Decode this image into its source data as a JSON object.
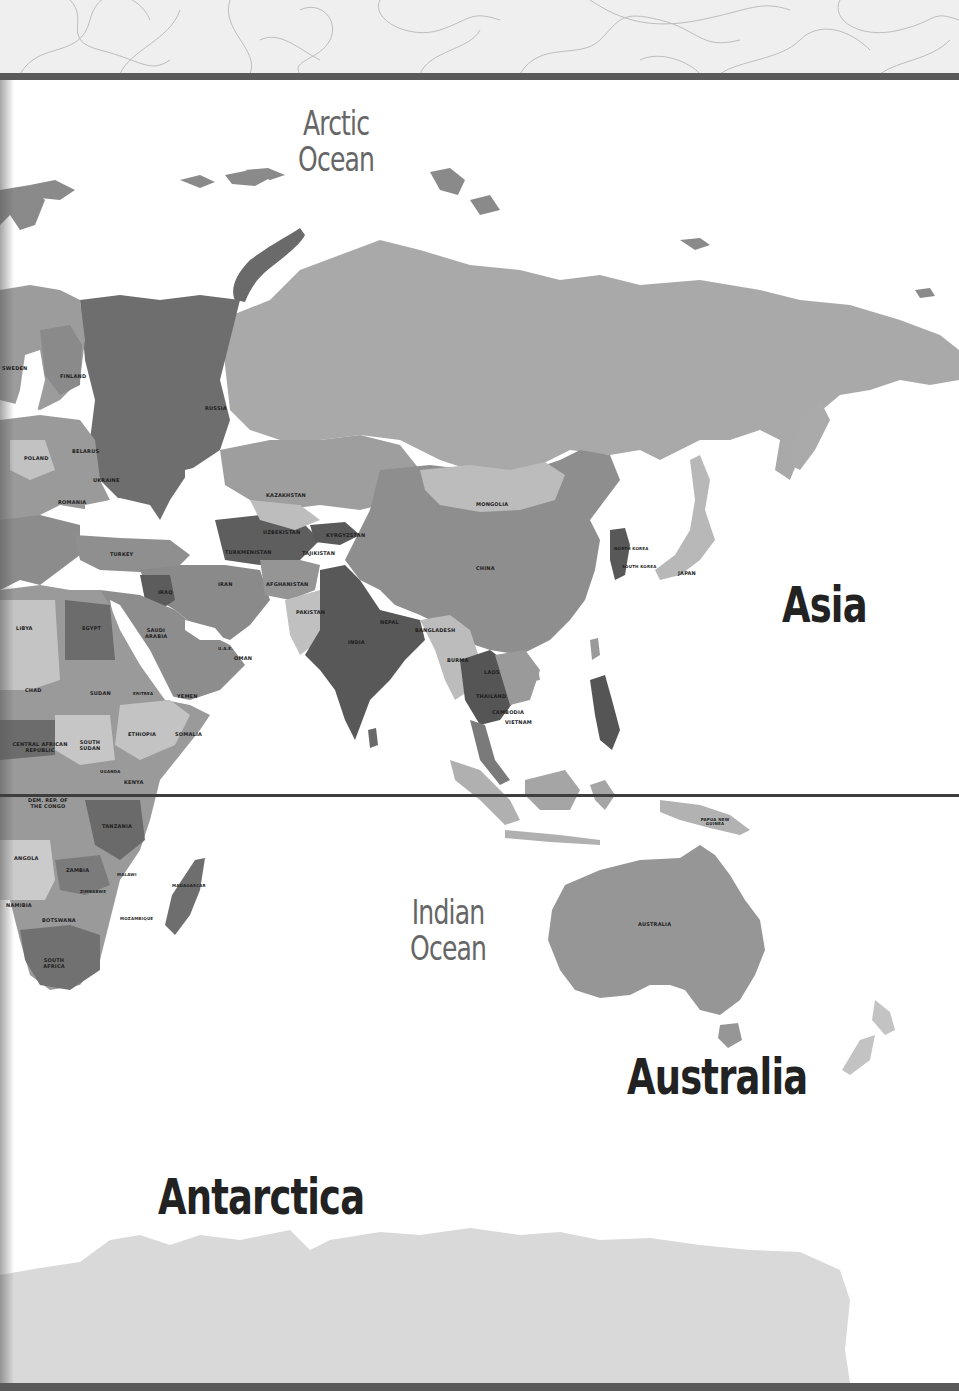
{
  "header": {
    "pattern": "topographic-contour-lines"
  },
  "oceans": [
    {
      "id": "arctic",
      "line1": "Arctic",
      "line2": "Ocean"
    },
    {
      "id": "indian",
      "line1": "Indian",
      "line2": "Ocean"
    }
  ],
  "continents": {
    "asia": "Asia",
    "australia": "Australia",
    "antarctica": "Antarctica"
  },
  "countries": {
    "russia": "RUSSIA",
    "finland": "FINLAND",
    "sweden": "SWEDEN",
    "poland": "POLAND",
    "belarus": "BELARUS",
    "ukraine": "UKRAINE",
    "romania": "ROMANIA",
    "turkey": "TURKEY",
    "kazakhstan": "KAZAKHSTAN",
    "uzbekistan": "UZBEKISTAN",
    "turkmenistan": "TURKMENISTAN",
    "kyrgyzstan": "KYRGYZSTAN",
    "tajikistan": "TAJIKISTAN",
    "iran": "IRAN",
    "iraq": "IRAQ",
    "afghanistan": "AFGHANISTAN",
    "pakistan": "PAKISTAN",
    "india": "INDIA",
    "nepal": "NEPAL",
    "bangladesh": "BANGLADESH",
    "mongolia": "MONGOLIA",
    "china": "CHINA",
    "north_korea": "NORTH KOREA",
    "south_korea": "SOUTH KOREA",
    "japan": "JAPAN",
    "burma": "BURMA",
    "laos": "LAOS",
    "thailand": "THAILAND",
    "cambodia": "CAMBODIA",
    "vietnam": "VIETNAM",
    "papua_new_guinea": "PAPUA NEW GUINEA",
    "australia": "AUSTRALIA",
    "libya": "LIBYA",
    "egypt": "EGYPT",
    "saudi_arabia": "SAUDI ARABIA",
    "oman": "OMAN",
    "yemen": "YEMEN",
    "uae": "U.A.E.",
    "chad": "CHAD",
    "sudan": "SUDAN",
    "eritrea": "ERITREA",
    "ethiopia": "ETHIOPIA",
    "somalia": "SOMALIA",
    "south_sudan": "SOUTH SUDAN",
    "central_african_republic": "CENTRAL AFRICAN REPUBLIC",
    "uganda": "UGANDA",
    "kenya": "KENYA",
    "dem_rep_congo": "DEM. REP. OF THE CONGO",
    "tanzania": "TANZANIA",
    "angola": "ANGOLA",
    "zambia": "ZAMBIA",
    "malawi": "MALAWI",
    "mozambique": "MOZAMBIQUE",
    "zimbabwe": "ZIMBABWE",
    "namibia": "NAMIBIA",
    "botswana": "BOTSWANA",
    "madagascar": "MADAGASCAR",
    "south_africa": "SOUTH AFRICA"
  },
  "colors": {
    "ocean": "#ffffff",
    "land_light": "#c9c9c9",
    "land_mid": "#a6a6a6",
    "land_dark": "#7d7d7d",
    "land_darker": "#626262",
    "antarctica": "#d9d9d9",
    "rule": "#5a5a5a",
    "equator": "#3e3e3e",
    "label_dark": "#222222",
    "label_ocean": "#666666"
  }
}
